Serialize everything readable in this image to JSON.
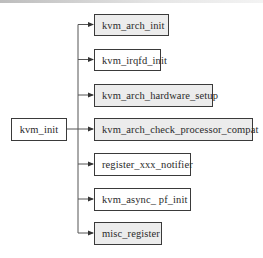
{
  "diagram": {
    "root": {
      "label": "kvm_init"
    },
    "children": [
      {
        "label": "kvm_arch_init",
        "fill": "gray"
      },
      {
        "label": "kvm_irqfd_init",
        "fill": "white"
      },
      {
        "label": "kvm_arch_hardware_setup",
        "fill": "gray"
      },
      {
        "label": "kvm_arch_check_processor_compat",
        "fill": "gray"
      },
      {
        "label": "register_xxx_notifier",
        "fill": "white"
      },
      {
        "label": "kvm_async_ pf_init",
        "fill": "white"
      },
      {
        "label": "misc_register",
        "fill": "gray"
      }
    ],
    "colors": {
      "border": "#3a3a3a",
      "gray_fill": "#ececec",
      "white_fill": "#ffffff",
      "line": "#555555"
    }
  }
}
